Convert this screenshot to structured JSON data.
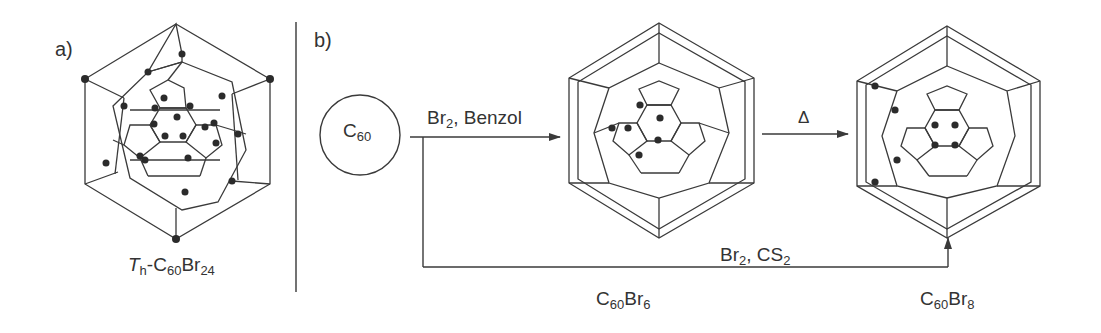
{
  "panels": {
    "a": {
      "label": "a)",
      "molecule": {
        "prefix_italic": "T",
        "prefix_sub": "h",
        "formula_parts": [
          "-C",
          "60",
          "Br",
          "24"
        ],
        "dots": 24
      }
    },
    "b": {
      "label": "b)",
      "start": {
        "main": "C",
        "sub": "60"
      },
      "reaction1": {
        "reagent": "Br",
        "reagent_sub": "2",
        "solvent": ", Benzol"
      },
      "reaction2": {
        "condition": "Δ"
      },
      "reaction3": {
        "reagent": "Br",
        "reagent_sub": "2",
        "sep": ", CS",
        "solvent_sub": "2"
      },
      "product1": {
        "c": "C",
        "c_sub": "60",
        "br": "Br",
        "br_sub": "6",
        "dots": 6
      },
      "product2": {
        "c": "C",
        "c_sub": "60",
        "br": "Br",
        "br_sub": "8",
        "dots": 8
      }
    }
  },
  "colors": {
    "line": "#3a3a3a",
    "dot": "#2b2b2b",
    "bg": "#ffffff"
  }
}
